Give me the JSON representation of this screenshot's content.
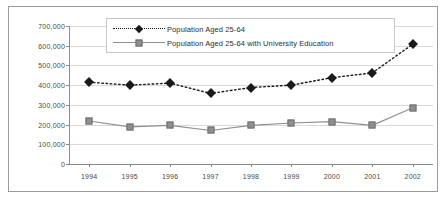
{
  "chart_data": {
    "type": "line",
    "title": "",
    "subtitle": "",
    "xlabel": "",
    "ylabel": "",
    "categories": [
      "1994",
      "1995",
      "1996",
      "1997",
      "1998",
      "1999",
      "2000",
      "2001",
      "2002"
    ],
    "series": [
      {
        "name": "Population Aged 25-64",
        "marker": "diamond",
        "line_style": "dotted",
        "color": "#1a1a1a",
        "values": [
          415000,
          400000,
          410000,
          358000,
          388000,
          400000,
          438000,
          462000,
          608000
        ]
      },
      {
        "name": "Population Aged 25-64 with University Education",
        "marker": "square",
        "line_style": "solid",
        "color": "#8f8f8f",
        "values": [
          218000,
          188000,
          196000,
          170000,
          196000,
          208000,
          215000,
          196000,
          285000
        ]
      }
    ],
    "ylim": [
      0,
      700000
    ],
    "ytick_values": [
      0,
      100000,
      200000,
      300000,
      400000,
      500000,
      600000,
      700000
    ],
    "ytick_labels": [
      "0",
      "100,000",
      "200,000",
      "300,000",
      "400,000",
      "500,000",
      "600,000",
      "700,000"
    ],
    "grid": true,
    "grid_axis": "y",
    "legend_position": "top-center",
    "legend_entries": [
      "Population Aged 25-64",
      "Population Aged 25-64 with University Education"
    ]
  },
  "colors": {
    "series_1": "#1a1a1a",
    "series_2": "#8f8f8f",
    "gridline": "#d9d9d9",
    "axis": "#8c8c8c",
    "frame_border": "#9a9a9a",
    "legend_border": "#c8c8c8",
    "tick_text": "#4a4a4a",
    "legend_text": "#2d2d2d",
    "background": "#ffffff"
  }
}
